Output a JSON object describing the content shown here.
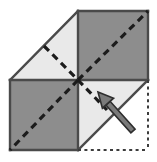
{
  "figure": {
    "canvas": {
      "width": 157,
      "height": 162,
      "background": "#ffffff"
    },
    "colors": {
      "dark_gray_fill": "#8d8d8d",
      "light_gray_fill": "#e9e9e9",
      "outline_stroke": "#4a4a4a",
      "dashed_stroke": "#1c1c1c",
      "dotted_stroke": "#3c3c3c",
      "arrow_fill": "#7a7a7a",
      "arrow_stroke": "#2e2e2e"
    },
    "geometry": {
      "grid_left": 10,
      "grid_mid_x": 78,
      "grid_right": 148,
      "grid_top": 11,
      "grid_mid_y": 80,
      "grid_bottom": 150
    },
    "panels": [
      {
        "name": "top-left-folded-triangle",
        "fill": "light_gray_fill",
        "points": "10,80 78,11 78,80",
        "description": "light gray folded flap, upper left"
      },
      {
        "name": "top-right-square",
        "fill": "dark_gray_fill",
        "points": "78,11 148,11 148,80 78,80",
        "description": "dark gray square, upper right"
      },
      {
        "name": "bottom-left-square",
        "fill": "dark_gray_fill",
        "points": "10,80 78,80 78,150 10,150",
        "description": "dark gray square, lower left"
      },
      {
        "name": "bottom-right-folded-triangle",
        "fill": "light_gray_fill",
        "points": "78,80 148,80 78,150",
        "description": "light gray folded flap, lower right"
      }
    ],
    "solid_edges": [
      {
        "name": "edge-top-right-top",
        "x1": 78,
        "y1": 11,
        "x2": 148,
        "y2": 11
      },
      {
        "name": "edge-top-right-right",
        "x1": 148,
        "y1": 11,
        "x2": 148,
        "y2": 80
      },
      {
        "name": "edge-horizontal-middle",
        "x1": 10,
        "y1": 80,
        "x2": 148,
        "y2": 80
      },
      {
        "name": "edge-vertical-middle",
        "x1": 78,
        "y1": 11,
        "x2": 78,
        "y2": 150
      },
      {
        "name": "edge-bottom-left-left",
        "x1": 10,
        "y1": 80,
        "x2": 10,
        "y2": 150
      },
      {
        "name": "edge-bottom-left-bottom",
        "x1": 10,
        "y1": 150,
        "x2": 78,
        "y2": 150
      },
      {
        "name": "fold-edge-upper-left",
        "x1": 10,
        "y1": 80,
        "x2": 78,
        "y2": 11
      },
      {
        "name": "fold-edge-lower-right",
        "x1": 78,
        "y1": 150,
        "x2": 148,
        "y2": 80
      }
    ],
    "dashed_lines": [
      {
        "name": "dashed-diagonal-top-right",
        "x1": 78,
        "y1": 80,
        "x2": 148,
        "y2": 11
      },
      {
        "name": "dashed-diagonal-bottom-left",
        "x1": 78,
        "y1": 80,
        "x2": 10,
        "y2": 150
      },
      {
        "name": "dashed-crease-top-left",
        "x1": 44,
        "y1": 46,
        "x2": 78,
        "y2": 80
      },
      {
        "name": "dashed-crease-bottom-right",
        "x1": 78,
        "y1": 80,
        "x2": 107,
        "y2": 110
      }
    ],
    "dotted_lines": [
      {
        "name": "dotted-edge-right",
        "x1": 148,
        "y1": 80,
        "x2": 148,
        "y2": 150
      },
      {
        "name": "dotted-edge-bottom",
        "x1": 78,
        "y1": 150,
        "x2": 148,
        "y2": 150
      }
    ],
    "arrow": {
      "name": "fold-direction-arrow",
      "tail_x": 133,
      "tail_y": 131,
      "tip_x": 98,
      "tip_y": 92,
      "direction": "up-left",
      "description": "arrow indicating the lower-right flap folds up and to the left"
    }
  }
}
